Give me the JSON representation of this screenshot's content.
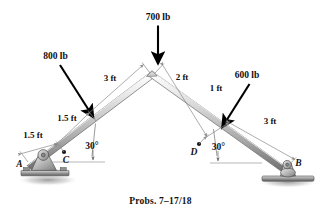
{
  "figure": {
    "caption": "Probs. 7–17/18",
    "background_color": "#ffffff",
    "loads": [
      {
        "id": "load-700",
        "label": "700 lb",
        "magnitude": 700,
        "unit": "lb",
        "direction": "vertical-down",
        "applied_at": "apex"
      },
      {
        "id": "load-800",
        "label": "800 lb",
        "magnitude": 800,
        "unit": "lb",
        "direction": "perpendicular-to-left-member",
        "applied_at": "3 ft from apex along left member"
      },
      {
        "id": "load-600",
        "label": "600 lb",
        "magnitude": 600,
        "unit": "lb",
        "direction": "perpendicular-to-right-member",
        "applied_at": "3 ft from B along right member"
      }
    ],
    "dimensions": [
      {
        "id": "dim-left-a-c",
        "label": "1.5 ft",
        "value": 1.5,
        "unit": "ft",
        "member": "left",
        "span": "A to C"
      },
      {
        "id": "dim-left-c-load",
        "label": "1.5 ft",
        "value": 1.5,
        "unit": "ft",
        "member": "left",
        "span": "C to 800 lb load point"
      },
      {
        "id": "dim-left-load-apex",
        "label": "3 ft",
        "value": 3,
        "unit": "ft",
        "member": "left",
        "span": "800 lb load point to apex"
      },
      {
        "id": "dim-right-apex-d",
        "label": "2 ft",
        "value": 2,
        "unit": "ft",
        "member": "right",
        "span": "apex to D"
      },
      {
        "id": "dim-right-d-load",
        "label": "1 ft",
        "value": 1,
        "unit": "ft",
        "member": "right",
        "span": "D to 600 lb load point"
      },
      {
        "id": "dim-right-load-b",
        "label": "3 ft",
        "value": 3,
        "unit": "ft",
        "member": "right",
        "span": "600 lb load point to B"
      }
    ],
    "angles": [
      {
        "id": "angle-left",
        "label": "30°",
        "value": 30,
        "unit": "deg",
        "at": "A",
        "measured_from": "horizontal"
      },
      {
        "id": "angle-right",
        "label": "30°",
        "value": 30,
        "unit": "deg",
        "at": "B",
        "measured_from": "horizontal"
      }
    ],
    "points": [
      {
        "id": "point-a",
        "label": "A",
        "role": "pin-support"
      },
      {
        "id": "point-b",
        "label": "B",
        "role": "roller-support"
      },
      {
        "id": "point-c",
        "label": "C",
        "role": "marked-point-left-member"
      },
      {
        "id": "point-d",
        "label": "D",
        "role": "marked-point-right-member"
      }
    ],
    "colors": {
      "member_light": "#f2f2f2",
      "member_mid": "#c9c9c9",
      "member_dark": "#7d7d7d",
      "support_fill": "#b8b8b8",
      "support_dark": "#6e6e6e",
      "dimension_line": "#8a8a8a",
      "load_arrow": "#000000",
      "text": "#101010"
    }
  }
}
